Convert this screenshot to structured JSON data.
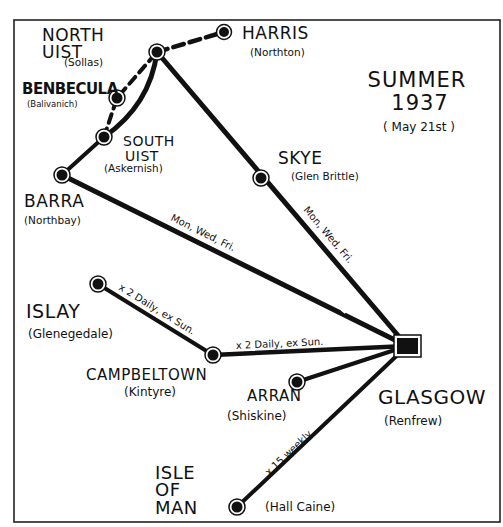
{
  "title": {
    "line1": "SUMMER",
    "line2": "1937",
    "line3": "( May 21st )"
  },
  "colors": {
    "ink": "#111111",
    "paper": "#ffffff"
  },
  "nodes": {
    "harris": {
      "name": "HARRIS",
      "sub": "(Northton)",
      "icon": "airport-dot-icon"
    },
    "north_uist": {
      "name1": "NORTH",
      "name2": "UIST",
      "sub": "(Sollas)",
      "icon": "airport-dot-icon"
    },
    "benbecula": {
      "name": "BENBECULA",
      "sub": "(Balivanich)",
      "icon": "airport-dot-icon"
    },
    "south_uist": {
      "name1": "SOUTH",
      "name2": "UIST",
      "sub": "(Askernish)",
      "icon": "airport-dot-icon"
    },
    "barra": {
      "name": "BARRA",
      "sub": "(Northbay)",
      "icon": "airport-dot-icon"
    },
    "skye": {
      "name": "SKYE",
      "sub": "(Glen Brittle)",
      "icon": "airport-dot-icon"
    },
    "islay": {
      "name": "ISLAY",
      "sub": "(Glenegedale)",
      "icon": "airport-dot-icon"
    },
    "campbeltown": {
      "name": "CAMPBELTOWN",
      "sub": "(Kintyre)",
      "icon": "airport-dot-icon"
    },
    "arran": {
      "name": "ARRAN",
      "sub": "(Shiskine)",
      "icon": "airport-dot-icon"
    },
    "glasgow": {
      "name": "GLASGOW",
      "sub": "(Renfrew)",
      "icon": "hub-square-icon"
    },
    "isle_of_man": {
      "name1": "ISLE",
      "name2": "OF",
      "name3": "MAN",
      "sub": "(Hall Caine)",
      "icon": "airport-dot-icon"
    }
  },
  "routes": {
    "glasgow_barra": {
      "freq": "Mon, Wed, Fri."
    },
    "glasgow_skye": {
      "freq": "Mon, Wed, Fri."
    },
    "glasgow_campbeltown": {
      "freq": "x 2 Daily, ex Sun."
    },
    "campbeltown_islay": {
      "freq": "x 2 Daily, ex Sun."
    },
    "glasgow_isle_of_man": {
      "freq": "x 15 weekly"
    }
  }
}
